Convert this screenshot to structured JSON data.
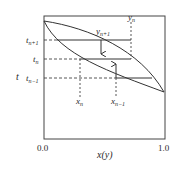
{
  "diagram": {
    "type": "t-x-y phase diagram (distillation stages)",
    "axes": {
      "y_label": "t",
      "x_label": "x(y)",
      "x_ticks": [
        "0.0",
        "1.0"
      ]
    },
    "levels": [
      {
        "id": "t_n_plus_1",
        "label": "t",
        "sub": "n+1"
      },
      {
        "id": "t_n",
        "label": "t",
        "sub": "n"
      },
      {
        "id": "t_n_minus_1",
        "label": "t",
        "sub": "n−1"
      }
    ],
    "compositions": [
      {
        "id": "x_n",
        "label": "x",
        "sub": "n"
      },
      {
        "id": "x_n_minus_1",
        "label": "x",
        "sub": "n−1"
      },
      {
        "id": "y_n",
        "label": "y",
        "sub": "n"
      },
      {
        "id": "y_n_plus_1",
        "label": "y",
        "sub": "n+1"
      }
    ],
    "curves": [
      "bubble-point (liquid) curve",
      "dew-point (vapor) curve"
    ],
    "arrows": [
      {
        "at": "y_n+1",
        "direction": "down"
      },
      {
        "at": "x_n-1",
        "direction": "up"
      }
    ],
    "colors": {
      "line": "#333333",
      "background": "#ffffff"
    }
  }
}
